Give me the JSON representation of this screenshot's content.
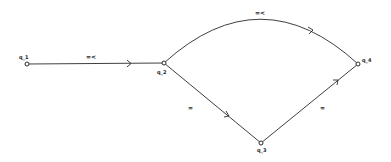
{
  "diagram": {
    "type": "automaton",
    "nodes": [
      {
        "id": "q_1",
        "label": "q_1",
        "x": 27,
        "y": 64
      },
      {
        "id": "q_2",
        "label": "q_2",
        "x": 164,
        "y": 63
      },
      {
        "id": "q_3",
        "label": "q_3",
        "x": 261,
        "y": 143
      },
      {
        "id": "q_4",
        "label": "q_4",
        "x": 358,
        "y": 64
      }
    ],
    "edges": [
      {
        "from": "q_1",
        "to": "q_2",
        "label": "=<",
        "shape": "straight"
      },
      {
        "from": "q_2",
        "to": "q_4",
        "label": "=<",
        "shape": "arc"
      },
      {
        "from": "q_2",
        "to": "q_3",
        "label": "=",
        "shape": "straight"
      },
      {
        "from": "q_3",
        "to": "q_4",
        "label": "=",
        "shape": "straight"
      }
    ],
    "colors": {
      "stroke": "#2a2a2a",
      "background": "#ffffff"
    }
  }
}
